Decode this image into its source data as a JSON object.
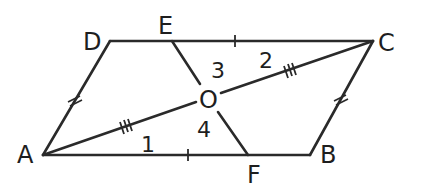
{
  "figure": {
    "type": "geometry-parallelogram",
    "colors": {
      "stroke": "#2a2a2a",
      "text": "#1e1e1e",
      "background": "#ffffff"
    },
    "points": {
      "A": {
        "label": "A",
        "x": 43,
        "y": 155
      },
      "B": {
        "label": "B",
        "x": 310,
        "y": 155
      },
      "C": {
        "label": "C",
        "x": 373,
        "y": 41
      },
      "D": {
        "label": "D",
        "x": 110,
        "y": 41
      },
      "E": {
        "label": "E",
        "x": 172,
        "y": 41
      },
      "F": {
        "label": "F",
        "x": 248,
        "y": 155
      },
      "O": {
        "label": "O",
        "x": 208,
        "y": 98
      }
    },
    "segments": [
      "AB",
      "BC",
      "CD",
      "DA",
      "AC",
      "EF"
    ],
    "angle_labels": {
      "a1": "1",
      "a2": "2",
      "a3": "3",
      "a4": "4"
    },
    "tick_marks": [
      {
        "segment": "AD",
        "count": 2
      },
      {
        "segment": "BC",
        "count": 2
      },
      {
        "segment": "AO",
        "count": 3
      },
      {
        "segment": "OC",
        "count": 3
      },
      {
        "segment": "EC",
        "count": 1
      },
      {
        "segment": "AF",
        "count": 1
      }
    ]
  }
}
